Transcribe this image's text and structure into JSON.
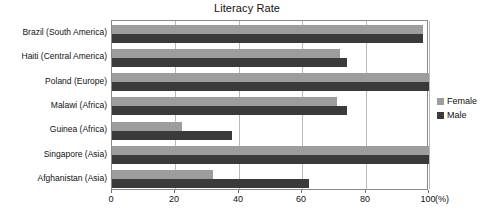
{
  "chart_data": {
    "type": "bar",
    "orientation": "horizontal",
    "title": "Literacy Rate",
    "xlabel": "(%)",
    "ylabel": "",
    "xlim": [
      0,
      100
    ],
    "xticks": [
      0,
      20,
      40,
      60,
      80,
      100
    ],
    "xtick_labels": [
      "0",
      "20",
      "40",
      "60",
      "80",
      "100"
    ],
    "grid": true,
    "grid_axis": "x",
    "legend_position": "right",
    "categories": [
      "Brazil (South America)",
      "Haiti (Central America)",
      "Poland (Europe)",
      "Malawi (Africa)",
      "Guinea (Africa)",
      "Singapore (Asia)",
      "Afghanistan (Asia)"
    ],
    "series": [
      {
        "name": "Female",
        "color": "#9d9d9d",
        "values": [
          98,
          72,
          100,
          71,
          22,
          100,
          32
        ]
      },
      {
        "name": "Male",
        "color": "#3a3a3a",
        "values": [
          98,
          74,
          100,
          74,
          38,
          100,
          62
        ]
      }
    ]
  },
  "axis": {
    "unit_label": "(%)"
  },
  "colors": {
    "female": "#9d9d9d",
    "male": "#3a3a3a",
    "grid": "#b9b9b9",
    "frame": "#8a8a8a",
    "text": "#111111"
  }
}
